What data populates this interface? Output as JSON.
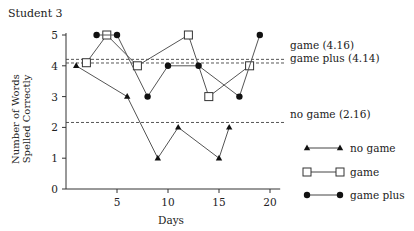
{
  "chart_data": {
    "type": "line",
    "title": "Student 3",
    "xlabel": "Days",
    "ylabel": "Number of Words Spelled Correctly",
    "ylabel_lines": [
      "Number of Words",
      "Spelled Correctly"
    ],
    "xlim": [
      0,
      21
    ],
    "ylim": [
      0,
      5
    ],
    "xticks": [
      5,
      10,
      15,
      20
    ],
    "yticks": [
      0,
      1,
      2,
      3,
      4,
      5
    ],
    "grid": false,
    "legend_position": "lower right",
    "series": [
      {
        "name": "no game",
        "marker": "triangle",
        "x": [
          1,
          6,
          9,
          11,
          15,
          16
        ],
        "y": [
          4,
          3,
          1,
          2,
          1,
          2
        ]
      },
      {
        "name": "game",
        "marker": "open-square",
        "x": [
          2,
          4,
          7,
          12,
          14,
          18
        ],
        "y": [
          4.1,
          5,
          4,
          5,
          3,
          4
        ]
      },
      {
        "name": "game plus",
        "marker": "filled-circle",
        "x": [
          3,
          5,
          8,
          10,
          13,
          17,
          19
        ],
        "y": [
          5,
          5,
          3,
          4,
          4,
          3,
          5
        ]
      }
    ],
    "reference_lines": [
      {
        "label": "game (4.16)",
        "value": 4.16,
        "style": "dashed"
      },
      {
        "label": "game plus (4.14)",
        "value": 4.14,
        "style": "dashed"
      },
      {
        "label": "no game (2.16)",
        "value": 2.16,
        "style": "dashed"
      }
    ]
  },
  "labels": {
    "title": "Student 3",
    "xlabel": "Days",
    "ylabel_line1": "Number of Words",
    "ylabel_line2": "Spelled Correctly",
    "ref_game": "game (4.16)",
    "ref_game_plus": "game plus (4.14)",
    "ref_no_game": "no game (2.16)",
    "legend_no_game": "no game",
    "legend_game": "game",
    "legend_game_plus": "game plus"
  }
}
